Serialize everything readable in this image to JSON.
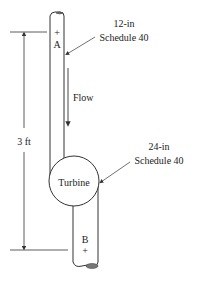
{
  "diagram": {
    "type": "pipe-turbine-schematic",
    "points": {
      "upper": {
        "label": "A",
        "marker": "+"
      },
      "lower": {
        "label": "B",
        "marker": "+"
      }
    },
    "upper_pipe": {
      "size": "12-in",
      "schedule": "Schedule 40"
    },
    "lower_pipe": {
      "size": "24-in",
      "schedule": "Schedule 40"
    },
    "component": {
      "label": "Turbine"
    },
    "flow": {
      "label": "Flow",
      "direction": "down"
    },
    "dimension": {
      "label": "3 ft",
      "between": [
        "A",
        "B"
      ]
    }
  },
  "colors": {
    "line": "#333333",
    "pipe_end_fill": "#888888",
    "background": "#ffffff"
  }
}
